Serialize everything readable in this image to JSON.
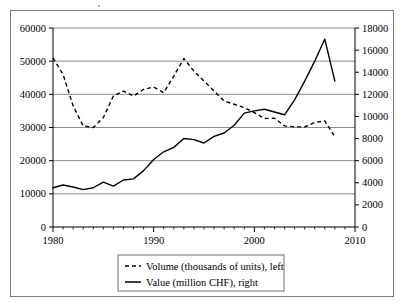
{
  "chart_data": {
    "type": "line",
    "title": "",
    "subtitle": "",
    "xlabel": "",
    "ylabel": "",
    "grid": true,
    "legend_position": "bottom",
    "x": [
      1980,
      1981,
      1982,
      1983,
      1984,
      1985,
      1986,
      1987,
      1988,
      1989,
      1990,
      1991,
      1992,
      1993,
      1994,
      1995,
      1996,
      1997,
      1998,
      1999,
      2000,
      2001,
      2002,
      2003,
      2004,
      2005,
      2006,
      2007,
      2008
    ],
    "xlim": [
      1980,
      2010
    ],
    "xticks": [
      1980,
      1990,
      2000,
      2010
    ],
    "xtick_labels": [
      "1980",
      "1990",
      "2000",
      "2010"
    ],
    "x_minor_tick_interval": 1,
    "left_axis": {
      "label": "",
      "ylim": [
        0,
        60000
      ],
      "yticks": [
        0,
        10000,
        20000,
        30000,
        40000,
        50000,
        60000
      ],
      "ytick_labels": [
        "0",
        "10000",
        "20000",
        "30000",
        "40000",
        "50000",
        "60000"
      ]
    },
    "right_axis": {
      "label": "",
      "ylim": [
        0,
        18000
      ],
      "yticks": [
        0,
        2000,
        4000,
        6000,
        8000,
        10000,
        12000,
        14000,
        16000,
        18000
      ],
      "ytick_labels": [
        "0",
        "2000",
        "4000",
        "6000",
        "8000",
        "10000",
        "12000",
        "14000",
        "16000",
        "18000"
      ]
    },
    "series": [
      {
        "name": "Volume (thousands of units), left",
        "axis": "left",
        "style": "dashed",
        "color": "#000000",
        "values": [
          51000,
          46000,
          36500,
          30500,
          30000,
          33000,
          39500,
          41000,
          39500,
          41500,
          42200,
          40500,
          45500,
          50800,
          47000,
          44000,
          41000,
          38000,
          37000,
          36000,
          34500,
          32700,
          32800,
          30500,
          30200,
          30200,
          31500,
          32000,
          27200
        ]
      },
      {
        "name": "Value (million CHF), right",
        "axis": "right",
        "style": "solid",
        "color": "#000000",
        "values": [
          3550,
          3800,
          3620,
          3380,
          3550,
          4050,
          3700,
          4250,
          4350,
          5100,
          6100,
          6800,
          7200,
          8000,
          7900,
          7600,
          8200,
          8500,
          9200,
          10300,
          10500,
          10650,
          10400,
          10150,
          11500,
          13200,
          15000,
          17000,
          13200
        ]
      }
    ]
  },
  "legend": {
    "items": [
      {
        "label": "Volume (thousands of units), left",
        "style": "dashed"
      },
      {
        "label": "Value (million CHF), right",
        "style": "solid"
      }
    ]
  }
}
